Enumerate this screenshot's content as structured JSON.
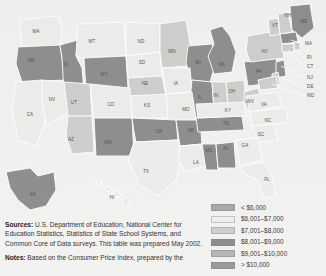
{
  "legend": {
    "title": "Per-pupil expenditure",
    "items": [
      {
        "label": "< $6,000",
        "color": "#a8a8a8"
      },
      {
        "label": "$6,001–$7,000",
        "color": "#ededeb"
      },
      {
        "label": "$7,001–$8,000",
        "color": "#cfcfcd"
      },
      {
        "label": "$8,001–$9,000",
        "color": "#8f8f8f"
      },
      {
        "label": "$9,001–$10,000",
        "color": "#b6b6b4"
      },
      {
        "label": "> $10,000",
        "color": "#9a9a9a"
      }
    ]
  },
  "notes": {
    "sources_lead": "Sources:",
    "sources_text": " U.S. Department of Education, National Center for Education Statistics, Statistics of State School Systems, and Common Core of Data surveys. This table was prepared May 2002.",
    "notes_lead": "Notes:",
    "notes_text": " Based on the Consumer Price Index, prepared by the"
  },
  "chart_data": {
    "type": "choropleth",
    "legend_position": "bottom-right",
    "bins": [
      "< $6,000",
      "$6,001–$7,000",
      "$7,001–$8,000",
      "$8,001–$9,000",
      "$9,001–$10,000",
      "> $10,000"
    ],
    "bin_colors": [
      "#a8a8a8",
      "#ededeb",
      "#cfcfcd",
      "#8f8f8f",
      "#b6b6b4",
      "#9a9a9a"
    ],
    "states": [
      {
        "code": "WA",
        "bin": 1
      },
      {
        "code": "OR",
        "bin": 3
      },
      {
        "code": "ID",
        "bin": 3
      },
      {
        "code": "MT",
        "bin": 1
      },
      {
        "code": "WY",
        "bin": 3
      },
      {
        "code": "ND",
        "bin": 1
      },
      {
        "code": "SD",
        "bin": 1
      },
      {
        "code": "NE",
        "bin": 2
      },
      {
        "code": "MN",
        "bin": 2
      },
      {
        "code": "WI",
        "bin": 3
      },
      {
        "code": "IA",
        "bin": 1
      },
      {
        "code": "IL",
        "bin": 3
      },
      {
        "code": "IN",
        "bin": 2
      },
      {
        "code": "MI",
        "bin": 3
      },
      {
        "code": "OH",
        "bin": 2
      },
      {
        "code": "MO",
        "bin": 1
      },
      {
        "code": "KS",
        "bin": 1
      },
      {
        "code": "CA",
        "bin": 1
      },
      {
        "code": "NV",
        "bin": 1
      },
      {
        "code": "UT",
        "bin": 2
      },
      {
        "code": "AZ",
        "bin": 2
      },
      {
        "code": "CO",
        "bin": 1
      },
      {
        "code": "NM",
        "bin": 3
      },
      {
        "code": "OK",
        "bin": 3
      },
      {
        "code": "TX",
        "bin": 1
      },
      {
        "code": "AR",
        "bin": 3
      },
      {
        "code": "LA",
        "bin": 1
      },
      {
        "code": "MS",
        "bin": 3
      },
      {
        "code": "AL",
        "bin": 3
      },
      {
        "code": "TN",
        "bin": 3
      },
      {
        "code": "KY",
        "bin": 1
      },
      {
        "code": "WV",
        "bin": 2
      },
      {
        "code": "VA",
        "bin": 1
      },
      {
        "code": "NC",
        "bin": 1
      },
      {
        "code": "SC",
        "bin": 1
      },
      {
        "code": "GA",
        "bin": 1
      },
      {
        "code": "FL",
        "bin": 1
      },
      {
        "code": "PA",
        "bin": 3
      },
      {
        "code": "NY",
        "bin": 2
      },
      {
        "code": "VT",
        "bin": 2
      },
      {
        "code": "NH",
        "bin": 2
      },
      {
        "code": "ME",
        "bin": 3
      },
      {
        "code": "MA",
        "bin": 3
      },
      {
        "code": "RI",
        "bin": 2
      },
      {
        "code": "CT",
        "bin": 2
      },
      {
        "code": "NJ",
        "bin": 3
      },
      {
        "code": "DE",
        "bin": 2
      },
      {
        "code": "MD",
        "bin": 2
      },
      {
        "code": "AK",
        "bin": 3
      },
      {
        "code": "HI",
        "bin": 1
      }
    ]
  },
  "map": {
    "labels": [
      {
        "code": "WA",
        "x": 36,
        "y": 32
      },
      {
        "code": "OR",
        "x": 31,
        "y": 61
      },
      {
        "code": "ID",
        "x": 66,
        "y": 65
      },
      {
        "code": "MT",
        "x": 92,
        "y": 42
      },
      {
        "code": "WY",
        "x": 104,
        "y": 75
      },
      {
        "code": "ND",
        "x": 141,
        "y": 42
      },
      {
        "code": "SD",
        "x": 142,
        "y": 63
      },
      {
        "code": "NE",
        "x": 145,
        "y": 84
      },
      {
        "code": "MN",
        "x": 172,
        "y": 52
      },
      {
        "code": "WI",
        "x": 198,
        "y": 63
      },
      {
        "code": "IA",
        "x": 176,
        "y": 84
      },
      {
        "code": "IL",
        "x": 200,
        "y": 98
      },
      {
        "code": "IN",
        "x": 216,
        "y": 96
      },
      {
        "code": "MI",
        "x": 222,
        "y": 65
      },
      {
        "code": "OH",
        "x": 232,
        "y": 92
      },
      {
        "code": "MO",
        "x": 186,
        "y": 110
      },
      {
        "code": "KS",
        "x": 147,
        "y": 106
      },
      {
        "code": "CA",
        "x": 30,
        "y": 115
      },
      {
        "code": "NV",
        "x": 52,
        "y": 100
      },
      {
        "code": "UT",
        "x": 74,
        "y": 103
      },
      {
        "code": "AZ",
        "x": 71,
        "y": 140
      },
      {
        "code": "CO",
        "x": 111,
        "y": 105
      },
      {
        "code": "NM",
        "x": 108,
        "y": 143
      },
      {
        "code": "OK",
        "x": 159,
        "y": 132
      },
      {
        "code": "TX",
        "x": 146,
        "y": 172
      },
      {
        "code": "AR",
        "x": 191,
        "y": 131
      },
      {
        "code": "LA",
        "x": 196,
        "y": 163
      },
      {
        "code": "MS",
        "x": 209,
        "y": 151
      },
      {
        "code": "AL",
        "x": 226,
        "y": 149
      },
      {
        "code": "TN",
        "x": 226,
        "y": 124
      },
      {
        "code": "KY",
        "x": 228,
        "y": 111
      },
      {
        "code": "WV",
        "x": 250,
        "y": 102
      },
      {
        "code": "VA",
        "x": 264,
        "y": 105
      },
      {
        "code": "NC",
        "x": 268,
        "y": 121
      },
      {
        "code": "SC",
        "x": 261,
        "y": 135
      },
      {
        "code": "GA",
        "x": 245,
        "y": 146
      },
      {
        "code": "FL",
        "x": 267,
        "y": 180
      },
      {
        "code": "PA",
        "x": 259,
        "y": 72
      },
      {
        "code": "NY",
        "x": 265,
        "y": 52
      },
      {
        "code": "VT",
        "x": 275,
        "y": 26
      },
      {
        "code": "NH",
        "x": 288,
        "y": 16
      },
      {
        "code": "ME",
        "x": 304,
        "y": 22
      },
      {
        "code": "AK",
        "x": 33,
        "y": 195
      },
      {
        "code": "HI",
        "x": 112,
        "y": 198
      }
    ],
    "callouts": [
      {
        "code": "MA",
        "tx": 305,
        "ty": 44,
        "x1": 303,
        "y1": 44,
        "x2": 291,
        "y2": 40
      },
      {
        "code": "RI",
        "tx": 307,
        "ty": 58,
        "x1": 305,
        "y1": 58,
        "x2": 292,
        "y2": 47
      },
      {
        "code": "CT",
        "tx": 307,
        "ty": 67,
        "x1": 305,
        "y1": 67,
        "x2": 288,
        "y2": 50
      },
      {
        "code": "NJ",
        "tx": 307,
        "ty": 78,
        "x1": 305,
        "y1": 78,
        "x2": 281,
        "y2": 66
      },
      {
        "code": "DE",
        "tx": 307,
        "ty": 87,
        "x1": 305,
        "y1": 87,
        "x2": 277,
        "y2": 76
      },
      {
        "code": "MD",
        "tx": 307,
        "ty": 96,
        "x1": 305,
        "y1": 96,
        "x2": 272,
        "y2": 84
      }
    ]
  }
}
